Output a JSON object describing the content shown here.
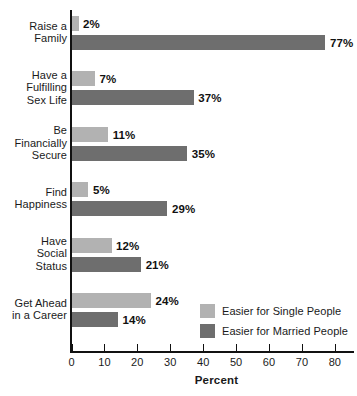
{
  "chart_data": {
    "type": "bar",
    "orientation": "horizontal",
    "title": "",
    "xlabel": "Percent",
    "ylabel": "",
    "xlim": [
      0,
      85
    ],
    "xticks": [
      0,
      10,
      20,
      30,
      40,
      50,
      60,
      70,
      80
    ],
    "xtick_labels": [
      "0",
      "10",
      "20",
      "30",
      "40",
      "50",
      "60",
      "70",
      "80"
    ],
    "grid": false,
    "legend_position": "inside-bottom-right",
    "categories": [
      "Raise a Family",
      "Have a Fulfilling Sex Life",
      "Be Financially Secure",
      "Find Happiness",
      "Have Social Status",
      "Get Ahead in a Career"
    ],
    "category_label_lines": [
      [
        "Raise a",
        "Family"
      ],
      [
        "Have a",
        "Fulfilling",
        "Sex Life"
      ],
      [
        "Be",
        "Financially",
        "Secure"
      ],
      [
        "Find",
        "Happiness"
      ],
      [
        "Have",
        "Social",
        "Status"
      ],
      [
        "Get Ahead",
        "in a Career"
      ]
    ],
    "series": [
      {
        "name": "Easier for Single People",
        "color": "#b2b2b2",
        "values": [
          2,
          7,
          11,
          5,
          12,
          24
        ],
        "labels": [
          "2%",
          "7%",
          "11%",
          "5%",
          "12%",
          "24%"
        ]
      },
      {
        "name": "Easier for Married People",
        "color": "#6e6e6e",
        "values": [
          77,
          37,
          35,
          29,
          21,
          14
        ],
        "labels": [
          "77%",
          "37%",
          "35%",
          "29%",
          "21%",
          "14%"
        ]
      }
    ]
  },
  "legend": {
    "items": [
      {
        "label": "Easier for Single People",
        "color": "#b2b2b2"
      },
      {
        "label": "Easier for Married People",
        "color": "#6e6e6e"
      }
    ]
  },
  "axis": {
    "x_title": "Percent"
  }
}
